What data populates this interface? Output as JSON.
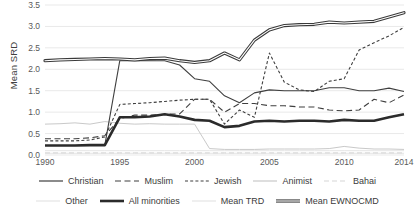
{
  "chart_data": {
    "type": "line",
    "title": "",
    "xlabel": "",
    "ylabel": "Mean SRD",
    "xlim": [
      1990,
      2014
    ],
    "ylim": [
      0,
      3.5
    ],
    "ytick_step": 0.5,
    "grid": "horizontal",
    "legend_position": "bottom",
    "x": [
      1990,
      1991,
      1992,
      1993,
      1994,
      1995,
      1996,
      1997,
      1998,
      1999,
      2000,
      2001,
      2002,
      2003,
      2004,
      2005,
      2006,
      2007,
      2008,
      2009,
      2010,
      2011,
      2012,
      2013,
      2014
    ],
    "xticks": [
      1990,
      1995,
      2000,
      2005,
      2010,
      2014
    ],
    "yticks": [
      "0.0",
      "0.5",
      "1.0",
      "1.5",
      "2.0",
      "2.5",
      "3.0",
      "3.5"
    ],
    "series": [
      {
        "name": "Christian",
        "style": "solid-thin",
        "color": "#3f3f3f",
        "values": [
          0.22,
          0.22,
          0.22,
          0.23,
          0.23,
          2.2,
          2.2,
          2.2,
          2.2,
          2.1,
          1.78,
          1.72,
          1.38,
          1.22,
          1.45,
          1.52,
          1.5,
          1.5,
          1.5,
          1.57,
          1.57,
          1.5,
          1.5,
          1.56,
          1.48
        ]
      },
      {
        "name": "Muslim",
        "style": "dashed-long",
        "color": "#3f3f3f",
        "values": [
          0.38,
          0.38,
          0.38,
          0.4,
          0.45,
          0.85,
          0.93,
          0.93,
          0.95,
          0.96,
          1.3,
          1.3,
          1.0,
          1.2,
          1.2,
          1.15,
          1.15,
          1.12,
          1.12,
          1.05,
          1.03,
          1.05,
          1.3,
          1.22,
          1.4
        ]
      },
      {
        "name": "Jewish",
        "style": "dashed-short",
        "color": "#3f3f3f",
        "values": [
          0.33,
          0.33,
          0.33,
          0.35,
          0.42,
          1.18,
          1.2,
          1.22,
          1.25,
          1.28,
          1.3,
          1.3,
          0.72,
          1.05,
          0.88,
          2.38,
          1.7,
          1.52,
          1.48,
          1.72,
          1.78,
          2.45,
          2.62,
          2.78,
          2.98
        ]
      },
      {
        "name": "Animist",
        "style": "solid-thin-light",
        "color": "#c4c4c4",
        "values": [
          0.72,
          0.73,
          0.75,
          0.72,
          0.78,
          0.74,
          0.72,
          0.73,
          0.72,
          0.72,
          0.72,
          0.15,
          0.13,
          0.13,
          0.13,
          0.14,
          0.14,
          0.14,
          0.14,
          0.15,
          0.2,
          0.16,
          0.14,
          0.14,
          0.13
        ]
      },
      {
        "name": "Bahai",
        "style": "dashed-light",
        "color": "#d2d2d2",
        "values": [
          0.05,
          0.05,
          0.05,
          0.05,
          0.05,
          0.05,
          0.05,
          0.05,
          0.05,
          0.05,
          0.05,
          0.05,
          0.05,
          0.05,
          0.05,
          0.05,
          0.05,
          0.05,
          0.05,
          0.05,
          0.05,
          0.05,
          0.05,
          0.05,
          0.05
        ]
      },
      {
        "name": "Other",
        "style": "solid-thin-lightest",
        "color": "#e0e0e0",
        "values": [
          0.1,
          0.1,
          0.1,
          0.1,
          0.1,
          0.1,
          0.1,
          0.1,
          0.1,
          0.1,
          0.1,
          0.1,
          0.1,
          0.1,
          0.1,
          0.1,
          0.1,
          0.1,
          0.1,
          0.1,
          0.1,
          0.1,
          0.1,
          0.1,
          0.1
        ]
      },
      {
        "name": "All minorities",
        "style": "solid-thick",
        "color": "#2b2b2b",
        "values": [
          0.22,
          0.22,
          0.22,
          0.23,
          0.23,
          0.88,
          0.88,
          0.9,
          0.95,
          0.9,
          0.82,
          0.8,
          0.65,
          0.68,
          0.78,
          0.8,
          0.78,
          0.8,
          0.8,
          0.78,
          0.82,
          0.8,
          0.8,
          0.88,
          0.95
        ]
      },
      {
        "name": "Mean TRD",
        "style": "solid-thin-lightest",
        "color": "#e6e6e6",
        "values": [
          0.04,
          0.04,
          0.04,
          0.04,
          0.04,
          0.04,
          0.04,
          0.04,
          0.04,
          0.04,
          0.04,
          0.04,
          0.04,
          0.04,
          0.04,
          0.04,
          0.04,
          0.04,
          0.04,
          0.04,
          0.04,
          0.04,
          0.04,
          0.04,
          0.04
        ]
      },
      {
        "name": "Mean EWNOCMD",
        "style": "double-thick",
        "color": "#3a3a3a",
        "values": [
          2.2,
          2.22,
          2.23,
          2.24,
          2.25,
          2.24,
          2.22,
          2.25,
          2.26,
          2.2,
          2.16,
          2.2,
          2.38,
          2.22,
          2.68,
          2.92,
          3.02,
          3.04,
          3.05,
          3.1,
          3.08,
          3.1,
          3.12,
          3.22,
          3.32
        ]
      }
    ]
  },
  "legend": {
    "rows": [
      [
        {
          "label": "Christian",
          "style": "solid-thin"
        },
        {
          "label": "Muslim",
          "style": "dashed-long"
        },
        {
          "label": "Jewish",
          "style": "dashed-short"
        },
        {
          "label": "Animist",
          "style": "solid-thin-light"
        },
        {
          "label": "Bahai",
          "style": "dashed-light"
        }
      ],
      [
        {
          "label": "Other",
          "style": "solid-thin-lightest"
        },
        {
          "label": "All minorities",
          "style": "solid-thick"
        },
        {
          "label": "Mean TRD",
          "style": "solid-thin-lightest"
        },
        {
          "label": "Mean EWNOCMD",
          "style": "double-thick"
        }
      ]
    ]
  },
  "colors": {
    "grid": "#e9e9e9",
    "text": "#595959",
    "dark_line": "#3f3f3f",
    "light_line": "#d2d2d2"
  }
}
